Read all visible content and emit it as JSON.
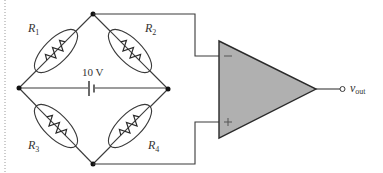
{
  "diagram": {
    "colors": {
      "wire": "#3a3a3a",
      "opamp_fill": "#b0b0b0",
      "background": "#ffffff"
    },
    "resistors": [
      {
        "id": "R1",
        "label": "R",
        "subscript": "1"
      },
      {
        "id": "R2",
        "label": "R",
        "subscript": "2"
      },
      {
        "id": "R3",
        "label": "R",
        "subscript": "3"
      },
      {
        "id": "R4",
        "label": "R",
        "subscript": "4"
      }
    ],
    "source": {
      "label": "10 V"
    },
    "opamp": {
      "inverting_sign": "−",
      "noninverting_sign": "+"
    },
    "output": {
      "label": "v",
      "subscript": "out"
    }
  }
}
